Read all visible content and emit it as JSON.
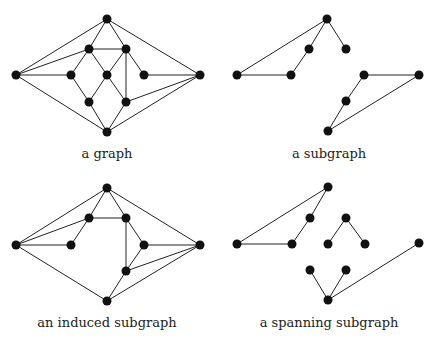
{
  "panels": [
    {
      "id": "graph",
      "caption": "a graph",
      "caption_pos": [
        107,
        158
      ],
      "nodes": {
        "top": [
          107,
          19
        ],
        "left": [
          16,
          75
        ],
        "right": [
          200,
          75
        ],
        "bottom": [
          107,
          132
        ],
        "uli": [
          89,
          49
        ],
        "uri": [
          126,
          49
        ],
        "midleft": [
          71,
          75
        ],
        "center": [
          107,
          75
        ],
        "midright": [
          144,
          75
        ],
        "lli": [
          89,
          102
        ],
        "lri": [
          126,
          102
        ]
      },
      "edges": [
        [
          "left",
          "top"
        ],
        [
          "left",
          "uli"
        ],
        [
          "left",
          "midleft"
        ],
        [
          "left",
          "bottom"
        ],
        [
          "top",
          "uli"
        ],
        [
          "top",
          "uri"
        ],
        [
          "top",
          "right"
        ],
        [
          "uli",
          "uri"
        ],
        [
          "uli",
          "midleft"
        ],
        [
          "uli",
          "center"
        ],
        [
          "uri",
          "center"
        ],
        [
          "uri",
          "midright"
        ],
        [
          "uri",
          "lri"
        ],
        [
          "midleft",
          "lli"
        ],
        [
          "center",
          "lli"
        ],
        [
          "center",
          "lri"
        ],
        [
          "midright",
          "right"
        ],
        [
          "lri",
          "right"
        ],
        [
          "lli",
          "bottom"
        ],
        [
          "lri",
          "bottom"
        ],
        [
          "bottom",
          "right"
        ]
      ]
    },
    {
      "id": "subgraph",
      "caption": "a subgraph",
      "caption_pos": [
        329,
        158
      ],
      "nodes": {
        "top": [
          327,
          19
        ],
        "left": [
          237,
          75
        ],
        "uli": [
          309,
          49
        ],
        "uri": [
          346,
          49
        ],
        "midleft": [
          291,
          75
        ],
        "midright": [
          364,
          75
        ],
        "right": [
          419,
          75
        ],
        "lri": [
          346,
          101
        ],
        "bottom": [
          328,
          131
        ]
      },
      "edges": [
        [
          "left",
          "top"
        ],
        [
          "top",
          "uli"
        ],
        [
          "uli",
          "midleft"
        ],
        [
          "midleft",
          "left"
        ],
        [
          "top",
          "uri"
        ],
        [
          "midright",
          "right"
        ],
        [
          "midright",
          "lri"
        ],
        [
          "lri",
          "bottom"
        ],
        [
          "bottom",
          "right"
        ]
      ]
    },
    {
      "id": "induced-subgraph",
      "caption": "an induced subgraph",
      "caption_pos": [
        107,
        327
      ],
      "nodes": {
        "top": [
          107,
          188
        ],
        "left": [
          16,
          245
        ],
        "right": [
          200,
          245
        ],
        "bottom": [
          107,
          301
        ],
        "uli": [
          89,
          218
        ],
        "uri": [
          126,
          218
        ],
        "midleft": [
          71,
          245
        ],
        "midright": [
          144,
          245
        ],
        "lri": [
          126,
          271
        ]
      },
      "edges": [
        [
          "left",
          "top"
        ],
        [
          "left",
          "uli"
        ],
        [
          "left",
          "midleft"
        ],
        [
          "left",
          "bottom"
        ],
        [
          "top",
          "uli"
        ],
        [
          "top",
          "uri"
        ],
        [
          "top",
          "right"
        ],
        [
          "uli",
          "uri"
        ],
        [
          "uli",
          "midleft"
        ],
        [
          "uri",
          "midright"
        ],
        [
          "uri",
          "lri"
        ],
        [
          "midright",
          "right"
        ],
        [
          "midright",
          "lri"
        ],
        [
          "lri",
          "right"
        ],
        [
          "lri",
          "bottom"
        ],
        [
          "bottom",
          "right"
        ]
      ]
    },
    {
      "id": "spanning-subgraph",
      "caption": "a spanning subgraph",
      "caption_pos": [
        329,
        327
      ],
      "nodes": {
        "top": [
          328,
          187
        ],
        "left": [
          237,
          244
        ],
        "uli": [
          310,
          218
        ],
        "midleft": [
          292,
          244
        ],
        "uri": [
          346,
          218
        ],
        "center": [
          328,
          244
        ],
        "midright": [
          365,
          244
        ],
        "right": [
          419,
          243
        ],
        "lli": [
          310,
          270
        ],
        "lri": [
          346,
          270
        ],
        "bottom": [
          328,
          300
        ]
      },
      "edges": [
        [
          "left",
          "top"
        ],
        [
          "top",
          "uli"
        ],
        [
          "uli",
          "midleft"
        ],
        [
          "midleft",
          "left"
        ],
        [
          "uri",
          "center"
        ],
        [
          "uri",
          "midright"
        ],
        [
          "lli",
          "bottom"
        ],
        [
          "lri",
          "bottom"
        ],
        [
          "bottom",
          "right"
        ]
      ]
    }
  ],
  "style": {
    "node_color": "#111111",
    "edge_color": "#222222",
    "node_radius": 4.5
  }
}
